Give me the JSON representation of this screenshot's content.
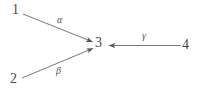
{
  "figure": {
    "type": "directed-graph-diagram",
    "background_color": "#ffffff",
    "stroke_color": "#595959",
    "text_color": "#4a4a4a"
  },
  "nodes": [
    {
      "id": "1",
      "label": "1",
      "x": 17,
      "y": 10
    },
    {
      "id": "2",
      "label": "2",
      "x": 15,
      "y": 79
    },
    {
      "id": "3",
      "label": "3",
      "x": 99,
      "y": 44
    },
    {
      "id": "4",
      "label": "4",
      "x": 187,
      "y": 45
    }
  ],
  "edges": [
    {
      "id": "edge-1-3",
      "from": "1",
      "to": "3",
      "label": "α",
      "label_x": 61,
      "label_y": 20,
      "direction": "to-3",
      "x1": 23,
      "y1": 14,
      "x2": 93,
      "y2": 42
    },
    {
      "id": "edge-2-3",
      "from": "2",
      "to": "3",
      "label": "β",
      "label_x": 60,
      "label_y": 72,
      "direction": "to-3",
      "x1": 22,
      "y1": 78,
      "x2": 93,
      "y2": 48
    },
    {
      "id": "edge-4-3",
      "from": "4",
      "to": "3",
      "label": "γ",
      "label_x": 145,
      "label_y": 36,
      "direction": "to-3",
      "x1": 180,
      "y1": 45.5,
      "x2": 108,
      "y2": 45.5
    }
  ],
  "labels": {
    "node_1": "1",
    "node_2": "2",
    "node_3": "3",
    "node_4": "4",
    "alpha": "α",
    "beta": "β",
    "gamma": "γ"
  }
}
